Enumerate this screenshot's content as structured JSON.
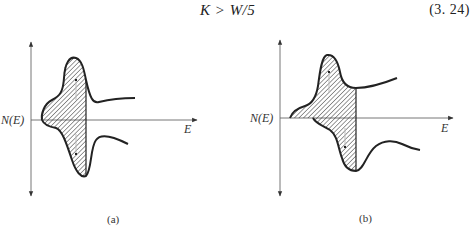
{
  "equation": {
    "expression": "K > W/5",
    "number": "(3. 24)"
  },
  "figures": [
    {
      "id": "a",
      "caption": "(a)",
      "y_axis_label": "N(E)",
      "x_axis_label": "E"
    },
    {
      "id": "b",
      "caption": "(b)",
      "y_axis_label": "N(E)",
      "x_axis_label": "E"
    }
  ],
  "colors": {
    "ink": "#222222",
    "axis": "#555555"
  }
}
